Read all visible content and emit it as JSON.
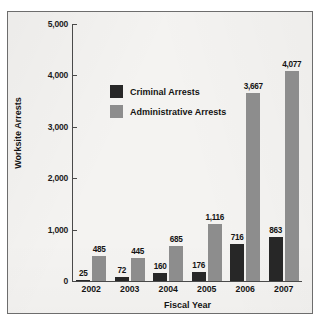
{
  "chart_data": {
    "type": "bar",
    "title": "",
    "subtitle": "",
    "xlabel": "Fiscal Year",
    "ylabel": "Worksite Arrests",
    "categories": [
      "2002",
      "2003",
      "2004",
      "2005",
      "2006",
      "2007"
    ],
    "series": [
      {
        "name": "Criminal Arrests",
        "color": "#272727",
        "values": [
          25,
          72,
          160,
          176,
          716,
          863
        ],
        "labels": [
          "25",
          "72",
          "160",
          "176",
          "716",
          "863"
        ]
      },
      {
        "name": "Administrative Arrests",
        "color": "#8d8d8d",
        "values": [
          485,
          445,
          685,
          1116,
          3667,
          4077
        ],
        "labels": [
          "485",
          "445",
          "685",
          "1,116",
          "3,667",
          "4,077"
        ]
      }
    ],
    "ylim": [
      0,
      5000
    ],
    "yticks": [
      0,
      1000,
      2000,
      3000,
      4000,
      5000
    ],
    "ytick_labels": [
      "0",
      "1,000",
      "2,000",
      "3,000",
      "4,000",
      "5,000"
    ],
    "grid": false,
    "legend_position": "inside-upper-left"
  },
  "axes": {
    "y_title": "Worksite Arrests",
    "x_title": "Fiscal Year"
  },
  "legend": {
    "items": [
      {
        "label": "Criminal Arrests",
        "color": "#272727"
      },
      {
        "label": "Administrative Arrests",
        "color": "#8d8d8d"
      }
    ]
  },
  "colors": {
    "criminal": "#272727",
    "administrative": "#8d8d8d",
    "axis": "#4a4a4a",
    "frame": "#6d6d6d",
    "background": "#f4f3f1",
    "text": "#141414"
  }
}
